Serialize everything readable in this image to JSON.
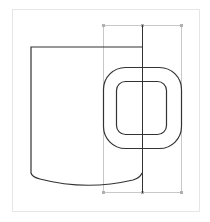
{
  "canvas": {
    "description": "Vector drawing of a mug with a selected handle shape",
    "colors": {
      "background": "#ffffff",
      "frame": "#e6e6e6",
      "stroke": "#333333",
      "selection": "#c8c8c8",
      "handle_point": "#b0b0b0"
    }
  },
  "objects": [
    {
      "name": "mug-body",
      "type": "path"
    },
    {
      "name": "mug-handle-outer",
      "type": "rounded-rect"
    },
    {
      "name": "mug-handle-inner",
      "type": "rounded-rect"
    },
    {
      "name": "center-guide",
      "type": "line"
    },
    {
      "name": "selection-box",
      "type": "bounding-box",
      "selected": true
    }
  ]
}
